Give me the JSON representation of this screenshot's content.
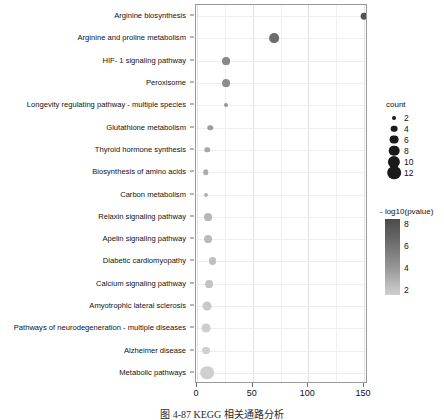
{
  "caption": "图 4-87  KEGG 相关通路分析",
  "chart_data": {
    "type": "scatter",
    "title": "",
    "xlabel": "",
    "ylabel": "",
    "xlim": [
      0,
      158
    ],
    "xticks": [
      0,
      50,
      100,
      150
    ],
    "xticklabels": [
      "0",
      "50",
      "100",
      "150"
    ],
    "grid": true,
    "categories": [
      "Arginine biosynthesis",
      "Arginine and proline metabolism",
      "HIF- 1 signaling pathway",
      "Peroxisome",
      "Longevity regulating pathway -  multiple species",
      "Glutathione metabolism",
      "Thyroid hormone synthesis",
      "Biosynthesis of amino acids",
      "Carbon metabolism",
      "Relaxin signaling pathway",
      "Apelin signaling pathway",
      "Diabetic cardiomyopathy",
      "Calcium signaling pathway",
      "Amyotrophic lateral sclerosis",
      "Pathways of neurodegeneration -  multiple diseases",
      "Alzheimer disease",
      "Metabolic pathways"
    ],
    "points": [
      {
        "pathway": "Arginine biosynthesis",
        "x": 150,
        "count": 4,
        "neglog10p": 7.6
      },
      {
        "pathway": "Arginine and proline metabolism",
        "x": 69,
        "count": 7,
        "neglog10p": 6.4
      },
      {
        "pathway": "HIF- 1 signaling pathway",
        "x": 26,
        "count": 5,
        "neglog10p": 5.2
      },
      {
        "pathway": "Peroxisome",
        "x": 26,
        "count": 5,
        "neglog10p": 5.0
      },
      {
        "pathway": "Longevity regulating pathway -  multiple species",
        "x": 26,
        "count": 2,
        "neglog10p": 4.6
      },
      {
        "pathway": "Glutathione metabolism",
        "x": 12,
        "count": 3,
        "neglog10p": 4.2
      },
      {
        "pathway": "Thyroid hormone synthesis",
        "x": 9,
        "count": 3,
        "neglog10p": 3.8
      },
      {
        "pathway": "Biosynthesis of amino acids",
        "x": 8,
        "count": 3,
        "neglog10p": 3.6
      },
      {
        "pathway": "Carbon metabolism",
        "x": 8,
        "count": 2,
        "neglog10p": 3.4
      },
      {
        "pathway": "Relaxin signaling pathway",
        "x": 10,
        "count": 5,
        "neglog10p": 3.1
      },
      {
        "pathway": "Apelin signaling pathway",
        "x": 10,
        "count": 5,
        "neglog10p": 2.9
      },
      {
        "pathway": "Diabetic cardiomyopathy",
        "x": 14,
        "count": 5,
        "neglog10p": 2.7
      },
      {
        "pathway": "Calcium signaling pathway",
        "x": 11,
        "count": 5,
        "neglog10p": 2.5
      },
      {
        "pathway": "Amyotrophic lateral sclerosis",
        "x": 9,
        "count": 6,
        "neglog10p": 2.3
      },
      {
        "pathway": "Pathways of neurodegeneration -  multiple diseases",
        "x": 8,
        "count": 6,
        "neglog10p": 2.1
      },
      {
        "pathway": "Alzheimer disease",
        "x": 8,
        "count": 5,
        "neglog10p": 2.0
      },
      {
        "pathway": "Metabolic pathways",
        "x": 9,
        "count": 12,
        "neglog10p": 2.0
      }
    ],
    "legends": {
      "size": {
        "title": "count",
        "values": [
          2,
          4,
          6,
          8,
          10,
          12
        ],
        "labels": [
          "2",
          "4",
          "6",
          "8",
          "10",
          "12"
        ]
      },
      "color": {
        "title": "- log10(pvalue)",
        "ticks": [
          8,
          6,
          4,
          2
        ],
        "labels": [
          "8",
          "6",
          "4",
          "2"
        ],
        "high_color": "#4a4a4a",
        "low_color": "#cfcfcf"
      }
    }
  }
}
